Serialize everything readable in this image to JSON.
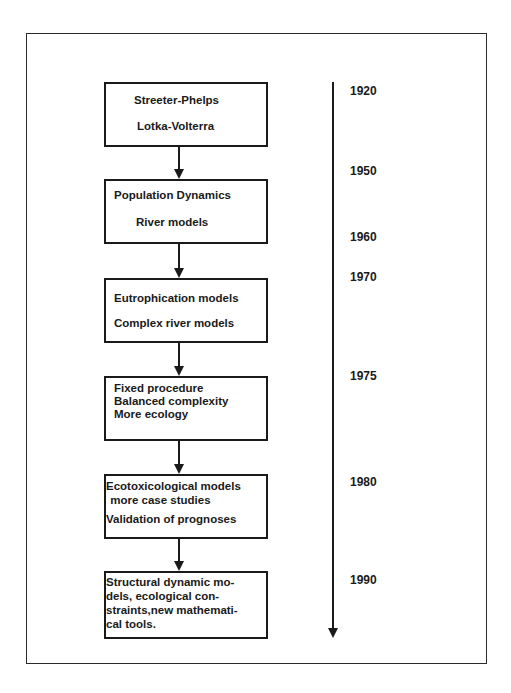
{
  "stages": [
    {
      "lines": [
        "Streeter-Phelps",
        "Lotka-Volterra"
      ]
    },
    {
      "lines": [
        "Population  Dynamics",
        "River models"
      ]
    },
    {
      "lines": [
        "Eutrophication  models",
        "Complex  river  models"
      ]
    },
    {
      "lines": [
        "Fixed  procedure",
        "Balanced  complexity",
        "More  ecology"
      ]
    },
    {
      "lines": [
        "Ecotoxicological  models",
        " more case studies",
        "Validation  of  prognoses"
      ]
    },
    {
      "lines": [
        "Structural  dynamic  mo-",
        "dels,  ecological  con-",
        "straints,new  mathemati-",
        "cal tools."
      ]
    }
  ],
  "timeline": {
    "years": [
      "1920",
      "1950",
      "1960",
      "1970",
      "1975",
      "1980",
      "1990"
    ]
  },
  "colors": {
    "ink": "#1a1a1a",
    "background": "#ffffff"
  }
}
